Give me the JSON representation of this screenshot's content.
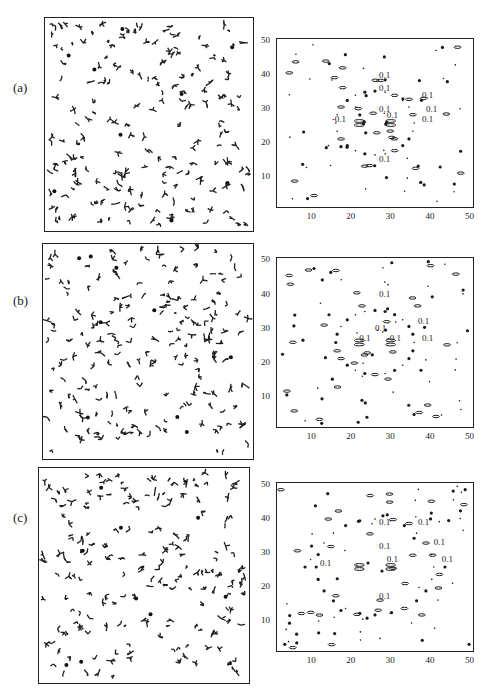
{
  "figure": {
    "panels": [
      {
        "id": "a",
        "label": "(a)"
      },
      {
        "id": "b",
        "label": "(b)"
      },
      {
        "id": "c",
        "label": "(c)"
      }
    ],
    "contour_axes": {
      "x_ticks": [
        "10",
        "20",
        "30",
        "40",
        "50"
      ],
      "y_ticks": [
        "10",
        "20",
        "30",
        "40",
        "50"
      ]
    },
    "contour_level_label": "0.1",
    "contour_neg_label": "-0.1"
  },
  "chart_data": [
    {
      "type": "scatter",
      "panel": "(a)",
      "title": "",
      "description": "Real-space configuration of scattered small cross/branch-shaped particles with a few solid dots",
      "xlabel": "",
      "ylabel": ""
    },
    {
      "type": "heatmap",
      "panel": "(a)",
      "subtype": "contour",
      "xlabel": "",
      "ylabel": "",
      "xlim": [
        1,
        51
      ],
      "ylim": [
        1,
        51
      ],
      "x_ticks": [
        10,
        20,
        30,
        40,
        50
      ],
      "y_ticks": [
        10,
        20,
        30,
        40,
        50
      ],
      "contour_labels": [
        "0.1",
        "0.1",
        "0.1",
        "0.1",
        "-0.1",
        "0.1",
        "0.1",
        "0.1",
        "0.1"
      ],
      "symmetry": "centrosymmetric about (26,26), ring of peaks radius ~10"
    },
    {
      "type": "scatter",
      "panel": "(b)",
      "description": "Real-space configuration of scattered cross/branch-shaped particles with a few solid dots"
    },
    {
      "type": "heatmap",
      "panel": "(b)",
      "subtype": "contour",
      "xlim": [
        1,
        51
      ],
      "ylim": [
        1,
        51
      ],
      "x_ticks": [
        10,
        20,
        30,
        40,
        50
      ],
      "y_ticks": [
        10,
        20,
        30,
        40,
        50
      ],
      "contour_labels": [
        "0.1",
        "0.1",
        "0.1",
        "0.1",
        "-0.1",
        "0.1"
      ],
      "symmetry": "centrosymmetric about (26,26)"
    },
    {
      "type": "scatter",
      "panel": "(c)",
      "description": "Real-space configuration of scattered cross/branch-shaped particles with a few solid dots"
    },
    {
      "type": "heatmap",
      "panel": "(c)",
      "subtype": "contour",
      "xlim": [
        1,
        51
      ],
      "ylim": [
        1,
        51
      ],
      "x_ticks": [
        10,
        20,
        30,
        40,
        50
      ],
      "y_ticks": [
        10,
        20,
        30,
        40,
        50
      ],
      "contour_labels": [
        "0.1",
        "0.1",
        "0.1",
        "0.1",
        "0.1",
        "0.1",
        "0.1",
        "0.1"
      ],
      "symmetry": "centrosymmetric about (26,26), peaks near corners"
    }
  ]
}
